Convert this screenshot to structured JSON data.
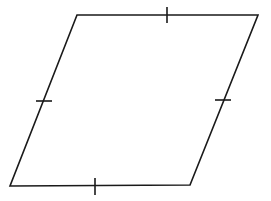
{
  "diagram": {
    "type": "rhombus",
    "stroke_color": "#1a1a1a",
    "background": "#ffffff",
    "vertices": {
      "top_left": [
        77,
        15
      ],
      "top_right": [
        258,
        15
      ],
      "bottom_right": [
        190,
        185
      ],
      "bottom_left": [
        10,
        186
      ]
    },
    "tick_marks": [
      {
        "side": "top",
        "x1": 167,
        "y1": 7,
        "x2": 167,
        "y2": 23
      },
      {
        "side": "bottom",
        "x1": 95,
        "y1": 178,
        "x2": 95,
        "y2": 195
      },
      {
        "side": "left",
        "x1": 36,
        "y1": 101,
        "x2": 52,
        "y2": 101
      },
      {
        "side": "right",
        "x1": 215,
        "y1": 100,
        "x2": 231,
        "y2": 100
      }
    ]
  }
}
